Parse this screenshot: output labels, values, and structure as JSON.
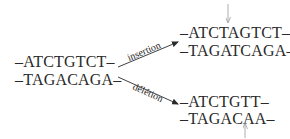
{
  "diagram": {
    "original": {
      "strand_top": "–ATCTGTCT–",
      "strand_bottom": "–TAGACAGA–"
    },
    "insertion": {
      "arrow_label": "insertion",
      "strand_top": "–ATCTAGTCT–",
      "strand_bottom": "–TAGATCAGA–",
      "marker": "down-arrow"
    },
    "deletion": {
      "arrow_label": "délétion",
      "strand_top": "–ATCTGTT–",
      "strand_bottom": "–TAGACAA–",
      "marker": "up-arrow"
    },
    "colors": {
      "text": "#2a2a2a",
      "marker": "#9a9a9a"
    }
  }
}
